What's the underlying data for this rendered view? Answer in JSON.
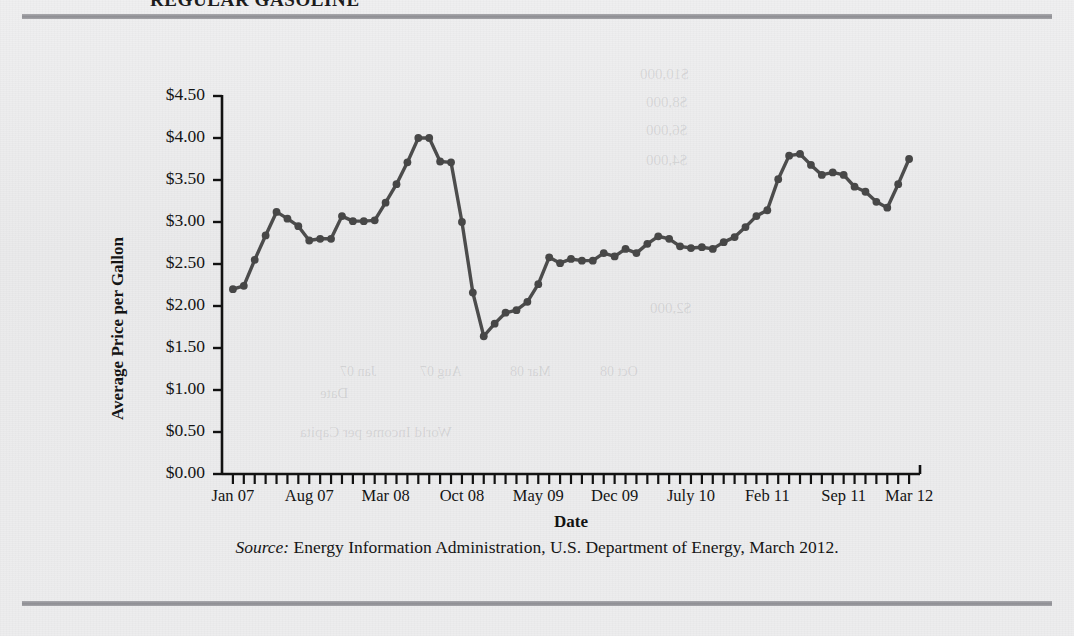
{
  "figure": {
    "title": "REGULAR GASOLINE",
    "source_prefix": "Source:",
    "source_text": " Energy Information Administration, U.S. Department of Energy, March 2012."
  },
  "ghost_text": {
    "g1": "$10,000",
    "g2": "$8,000",
    "g3": "$6,000",
    "g4": "$4,000",
    "g5": "$2,000",
    "g6": "Date",
    "g7": "World Income per Capita",
    "g8": "Jan 07",
    "g9": "Aug 07",
    "g10": "Mar 08",
    "g11": "Oct 08"
  },
  "colors": {
    "line": "#4c4c4c",
    "marker": "#474747",
    "axis": "#121212",
    "rule": "#93939a",
    "background": "#ececed"
  },
  "chart_data": {
    "type": "line",
    "title": "REGULAR GASOLINE",
    "xlabel": "Date",
    "ylabel": "Average Price per Gallon",
    "ylim": [
      0,
      4.5
    ],
    "ytick_labels": [
      "$0.00",
      "$0.50",
      "$1.00",
      "$1.50",
      "$2.00",
      "$2.50",
      "$3.00",
      "$3.50",
      "$4.00",
      "$4.50"
    ],
    "ytick_values": [
      0,
      0.5,
      1.0,
      1.5,
      2.0,
      2.5,
      3.0,
      3.5,
      4.0,
      4.5
    ],
    "xtick_labels": [
      "Jan 07",
      "Aug 07",
      "Mar 08",
      "Oct 08",
      "May 09",
      "Dec 09",
      "July 10",
      "Feb 11",
      "Sep 11",
      "Mar 12"
    ],
    "xtick_indices": [
      0,
      7,
      14,
      21,
      28,
      35,
      42,
      49,
      56,
      62
    ],
    "grid": false,
    "legend": "none",
    "x": [
      "Jan 07",
      "Feb 07",
      "Mar 07",
      "Apr 07",
      "May 07",
      "Jun 07",
      "Jul 07",
      "Aug 07",
      "Sep 07",
      "Oct 07",
      "Nov 07",
      "Dec 07",
      "Jan 08",
      "Feb 08",
      "Mar 08",
      "Apr 08",
      "May 08",
      "Jun 08",
      "Jul 08",
      "Aug 08",
      "Sep 08",
      "Oct 08",
      "Nov 08",
      "Dec 08",
      "Jan 09",
      "Feb 09",
      "Mar 09",
      "Apr 09",
      "May 09",
      "Jun 09",
      "Jul 09",
      "Aug 09",
      "Sep 09",
      "Oct 09",
      "Nov 09",
      "Dec 09",
      "Jan 10",
      "Feb 10",
      "Mar 10",
      "Apr 10",
      "May 10",
      "Jun 10",
      "Jul 10",
      "Aug 10",
      "Sep 10",
      "Oct 10",
      "Nov 10",
      "Dec 10",
      "Jan 11",
      "Feb 11",
      "Mar 11",
      "Apr 11",
      "May 11",
      "Jun 11",
      "Jul 11",
      "Aug 11",
      "Sep 11",
      "Oct 11",
      "Nov 11",
      "Dec 11",
      "Jan 12",
      "Feb 12",
      "Mar 12"
    ],
    "values": [
      2.2,
      2.24,
      2.55,
      2.84,
      3.12,
      3.04,
      2.95,
      2.78,
      2.8,
      2.8,
      3.07,
      3.01,
      3.01,
      3.02,
      3.23,
      3.45,
      3.71,
      4.0,
      4.0,
      3.72,
      3.71,
      3.0,
      2.16,
      1.64,
      1.79,
      1.92,
      1.95,
      2.05,
      2.26,
      2.58,
      2.51,
      2.56,
      2.54,
      2.54,
      2.63,
      2.59,
      2.68,
      2.63,
      2.74,
      2.83,
      2.8,
      2.71,
      2.69,
      2.7,
      2.68,
      2.76,
      2.82,
      2.94,
      3.07,
      3.14,
      3.51,
      3.79,
      3.81,
      3.68,
      3.56,
      3.59,
      3.56,
      3.42,
      3.36,
      3.24,
      3.17,
      3.45,
      3.75
    ]
  }
}
